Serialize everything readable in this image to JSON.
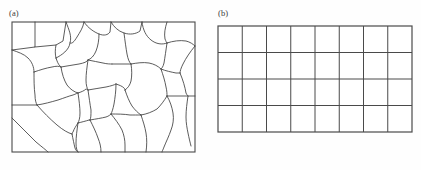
{
  "figure": {
    "background_color": "#fefefe",
    "line_color": "#3f3f3f",
    "border_color": "#4a4a4a",
    "width": 421,
    "height": 170,
    "panels": [
      {
        "id": "a",
        "label": "(a)",
        "caption_text": "(a)",
        "type": "irregular-grain-tessellation",
        "description": "Irregular polygonal grain structure / unstructured mesh",
        "frame": {
          "x": 12,
          "y": 22,
          "width": 183,
          "height": 130
        },
        "grain_count": 24
      },
      {
        "id": "b",
        "label": "(b)",
        "caption_text": "(b)",
        "type": "structured-rectangular-grid",
        "description": "Regular structured quadrilateral grid",
        "frame": {
          "x": 13,
          "y": 26,
          "width": 194,
          "height": 106
        },
        "columns": 8,
        "rows": 4,
        "cell_width": 24.25,
        "cell_height": 26.5
      }
    ]
  },
  "chart_data": {
    "type": "diagram",
    "title": "",
    "panels": [
      {
        "label": "(a)",
        "kind": "unstructured mesh",
        "cells": 24,
        "columns": null,
        "rows": null
      },
      {
        "label": "(b)",
        "kind": "structured grid",
        "cells": 32,
        "columns": 8,
        "rows": 4
      }
    ]
  }
}
